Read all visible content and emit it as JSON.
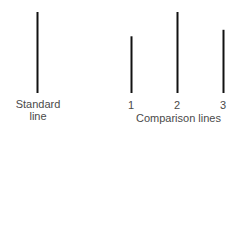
{
  "diagram": {
    "line_color": "#111111",
    "text_color": "#4a4a4a",
    "standard": {
      "label_line1": "Standard",
      "label_line2": "line",
      "relative_length": 1.0
    },
    "comparison": {
      "caption": "Comparison lines",
      "lines": [
        {
          "label": "1",
          "relative_length": 0.7
        },
        {
          "label": "2",
          "relative_length": 1.0
        },
        {
          "label": "3",
          "relative_length": 0.78
        }
      ]
    }
  }
}
